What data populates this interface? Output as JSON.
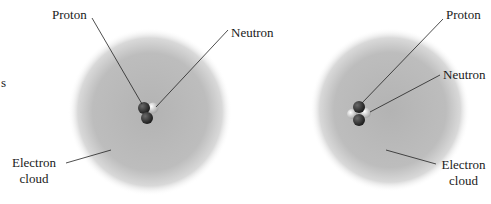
{
  "figure": {
    "left_atom": {
      "labels": {
        "proton": "Proton",
        "neutron": "Neutron",
        "electron_cloud_line1": "Electron",
        "electron_cloud_line2": "cloud"
      },
      "nucleus": {
        "protons": 2,
        "neutrons": 1
      }
    },
    "right_atom": {
      "labels": {
        "proton": "Proton",
        "neutron": "Neutron",
        "electron_cloud_line1": "Electron",
        "electron_cloud_line2": "cloud"
      },
      "nucleus": {
        "protons": 2,
        "neutrons": 2
      }
    },
    "edge_fragment": "s",
    "colors": {
      "cloud": "#b0b0b0",
      "proton": "#2e2e2e",
      "neutron": "#d8d8d8",
      "leader": "#222222",
      "text": "#1a1a1a"
    }
  }
}
